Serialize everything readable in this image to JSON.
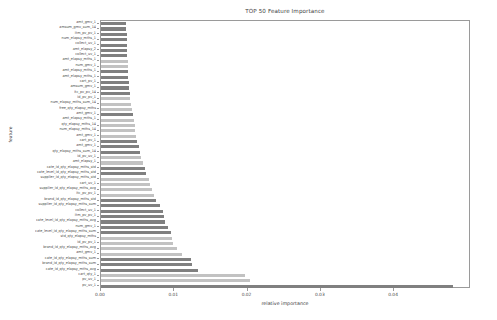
{
  "chart_data": {
    "type": "bar",
    "orientation": "horizontal",
    "title": "TOP 50 Feature Importance",
    "xlabel": "relative importance",
    "ylabel": "feature",
    "xlim": [
      0,
      0.0505
    ],
    "grid": false,
    "legend": null,
    "xticks": [
      "0.00",
      "0.01",
      "0.02",
      "0.03",
      "0.04"
    ],
    "xtick_values": [
      0.0,
      0.01,
      0.02,
      0.03,
      0.04
    ],
    "colors": {
      "bar_dark": "#808080",
      "bar_light": "#c2c2c2",
      "axis": "#9a9a9a",
      "text": "#3d3d3d",
      "background": "#ffffff"
    },
    "categories": [
      "amt_gmv_1",
      "amsum_gmv_sum_14",
      "itm_pv_pv_1",
      "num_elapsy_mths_1",
      "collect_uv_1",
      "amt_elapsy_2",
      "collect_uv_1",
      "amt_elapsy_mths_1",
      "num_gmv_1",
      "amt_elapsy_mths_1",
      "amt_elapsy_mths_1",
      "cart_pv_1",
      "amsum_gmv_1",
      "itc_pv_pv_14",
      "id_pv_pv_1",
      "num_elapsy_mths_sum_14",
      "free_qty_elapsy_mths",
      "amt_gmv_1",
      "amt_elapsy_mths_1",
      "qty_elapsy_mths_14",
      "num_elapsy_mths_14",
      "amt_gmv_1",
      "cart_pv_1",
      "amt_gmv_1",
      "qty_elapsy_mths_sum_14",
      "id_pv_uv_1",
      "amt_elapsy_1",
      "cate_id_qty_elapsy_mths_std",
      "cate_level_id_qty_elapsy_mths_std",
      "supplier_id_qty_elapsy_mths_std",
      "cart_uv_1",
      "supplier_id_qty_elapsy_mths_avg",
      "itc_pv_pv_1",
      "brand_id_qty_elapsy_mths_std",
      "supplier_id_qty_elapsy_mths_sum",
      "collect_uv_1",
      "itm_pv_pv_1",
      "cate_level_id_qty_elapsy_mths_avg",
      "num_gmv_1",
      "cate_level_id_qty_elapsy_mths_sum",
      "std_qty_elapsy_mths",
      "id_pv_pv_1",
      "brand_id_qty_elapsy_mths_avg",
      "amt_gmv_1",
      "cate_id_qty_elapsy_mths_sum",
      "brand_id_qty_elapsy_mths_sum",
      "cate_id_qty_elapsy_mths_avg",
      "cart_qty_1",
      "pv_uv_1",
      "pv_uv_1"
    ],
    "values": [
      0.00335,
      0.00345,
      0.0035,
      0.00352,
      0.00355,
      0.00358,
      0.0036,
      0.00362,
      0.00365,
      0.00368,
      0.00372,
      0.00378,
      0.00385,
      0.00392,
      0.004,
      0.00415,
      0.00428,
      0.0044,
      0.00448,
      0.00458,
      0.0047,
      0.0048,
      0.00495,
      0.00512,
      0.0053,
      0.00545,
      0.0057,
      0.00605,
      0.00615,
      0.0065,
      0.00665,
      0.0069,
      0.0072,
      0.00755,
      0.008,
      0.0084,
      0.00865,
      0.0088,
      0.0092,
      0.0095,
      0.00975,
      0.00985,
      0.0104,
      0.0111,
      0.01235,
      0.01245,
      0.01325,
      0.01965,
      0.0204,
      0.048
    ],
    "shades": [
      "dark",
      "dark",
      "dark",
      "dark",
      "dark",
      "dark",
      "dark",
      "light",
      "light",
      "dark",
      "dark",
      "dark",
      "dark",
      "dark",
      "light",
      "light",
      "light",
      "dark",
      "light",
      "light",
      "light",
      "light",
      "dark",
      "dark",
      "dark",
      "light",
      "light",
      "dark",
      "dark",
      "light",
      "light",
      "light",
      "light",
      "dark",
      "dark",
      "dark",
      "dark",
      "dark",
      "dark",
      "dark",
      "light",
      "light",
      "light",
      "light",
      "dark",
      "dark",
      "dark",
      "light",
      "light",
      "dark"
    ]
  }
}
